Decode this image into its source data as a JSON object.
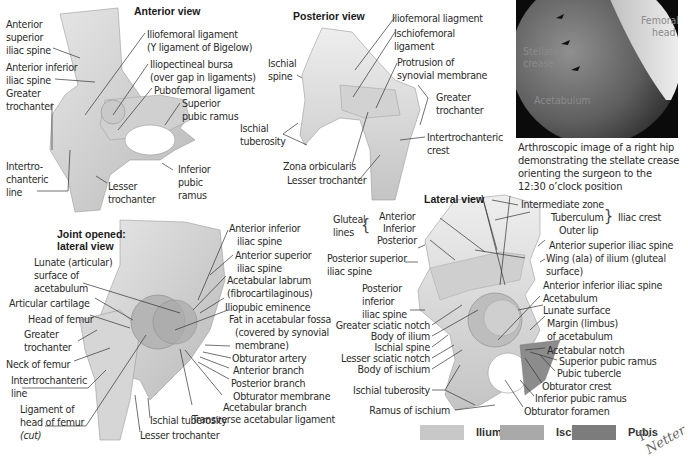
{
  "figure": {
    "panels": {
      "anterior": {
        "title": "Anterior view",
        "labels": [
          "Anterior",
          "superior",
          "iliac spine",
          "Anterior inferior",
          "iliac spine",
          "Greater",
          "trochanter",
          "Intertro-",
          "chanteric",
          "line",
          "Iliofemoral ligament",
          "(Y ligament of Bigelow)",
          "Iliopectineal bursa",
          "(over gap in ligaments)",
          "Pubofemoral ligament",
          "Superior",
          "pubic ramus",
          "Inferior",
          "pubic",
          "ramus",
          "Lesser",
          "trochanter"
        ]
      },
      "posterior": {
        "title": "Posterior view",
        "labels": [
          "Ischial",
          "spine",
          "Ischial",
          "tuberosity",
          "Zona orbicularis",
          "Lesser trochanter",
          "Iliofemoral liagment",
          "Ischiofemoral",
          "ligament",
          "Protrusion of",
          "synovial membrane",
          "Greater",
          "trochanter",
          "Intertrochanteric",
          "crest"
        ]
      },
      "photo": {
        "labels": [
          "Femoral",
          "head",
          "Stellate",
          "crease",
          "Acetabulum"
        ],
        "caption": [
          "Arthroscopic image of a right hip",
          "demonstrating the stellate crease",
          "orienting the surgeon to the",
          "12:30 o’clock position"
        ]
      },
      "joint_opened": {
        "title": [
          "Joint opened:",
          "lateral view"
        ],
        "labels": [
          "Lunate (articular)",
          "surface of",
          "acetabulum",
          "Articular cartilage",
          "Head of femur",
          "Greater",
          "trochanter",
          "Neck of femur",
          "Intertrochanteric",
          "line",
          "Ligament of",
          "head of femur",
          "(cut)",
          "Ischial tuberosity",
          "Lesser trochanter",
          "Anterior inferior",
          "iliac spine",
          "Anterior superior",
          "iliac spine",
          "Acetabular labrum",
          "(fibrocartilaginous)",
          "Iliopubic eminence",
          "Fat in acetabular fossa",
          "(covered by synovial",
          "membrane)",
          "Obturator artery",
          "Anterior branch",
          "Posterior branch",
          "Obturator membrane",
          "Acetabular branch",
          "Transverse acetabular ligament"
        ]
      },
      "lateral": {
        "title": "Lateral view",
        "labels": [
          "Gluteal",
          "lines",
          "Anterior",
          "Inferior",
          "Posterior",
          "Posterior superior",
          "iliac spine",
          "Posterior",
          "inferior",
          "iliac spine",
          "Greater sciatic notch",
          "Body of ilium",
          "Ischial spine",
          "Lesser sciatic notch",
          "Body of ischium",
          "Ischial tuberosity",
          "Ramus of ischium",
          "Intermediate zone",
          "Tuberculum",
          "Outer lip",
          "Iliac crest",
          "Anterior superior iliac spine",
          "Wing (ala) of ilium (gluteal",
          "surface)",
          "Anterior inferior iliac spine",
          "Acetabulum",
          "Lunate surface",
          "Margin (limbus)",
          "of acetabulum",
          "Acetabular notch",
          "Superior pubic ramus",
          "Pubic tubercle",
          "Obturator crest",
          "Inferior pubic ramus",
          "Obturator foramen"
        ]
      }
    },
    "legend": [
      {
        "label": "Ilium",
        "color": "#c8c8c8"
      },
      {
        "label": "Ischium",
        "color": "#a9a9a9"
      },
      {
        "label": "Pubis",
        "color": "#7c7c7c"
      }
    ],
    "signature": "F. Netter"
  }
}
